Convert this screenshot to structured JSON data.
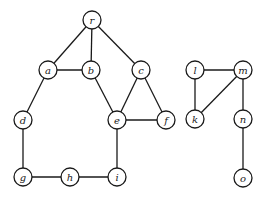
{
  "diagram": {
    "type": "undirected-graph",
    "node_radius": 9,
    "colors": {
      "stroke": "#1a1a1a",
      "fill": "#ffffff"
    },
    "nodes": [
      {
        "id": "r",
        "label": "r",
        "x": 92,
        "y": 20
      },
      {
        "id": "a",
        "label": "a",
        "x": 48,
        "y": 70
      },
      {
        "id": "b",
        "label": "b",
        "x": 91,
        "y": 70
      },
      {
        "id": "c",
        "label": "c",
        "x": 141,
        "y": 70
      },
      {
        "id": "d",
        "label": "d",
        "x": 23,
        "y": 120
      },
      {
        "id": "e",
        "label": "e",
        "x": 117,
        "y": 120
      },
      {
        "id": "f",
        "label": "f",
        "x": 166,
        "y": 120
      },
      {
        "id": "g",
        "label": "g",
        "x": 23,
        "y": 177
      },
      {
        "id": "h",
        "label": "h",
        "x": 70,
        "y": 177
      },
      {
        "id": "i",
        "label": "i",
        "x": 117,
        "y": 177
      },
      {
        "id": "l",
        "label": "l",
        "x": 195,
        "y": 70
      },
      {
        "id": "m",
        "label": "m",
        "x": 243,
        "y": 70
      },
      {
        "id": "k",
        "label": "k",
        "x": 195,
        "y": 119
      },
      {
        "id": "n",
        "label": "n",
        "x": 243,
        "y": 119
      },
      {
        "id": "o",
        "label": "o",
        "x": 243,
        "y": 178
      }
    ],
    "edges": [
      [
        "r",
        "a"
      ],
      [
        "r",
        "b"
      ],
      [
        "r",
        "c"
      ],
      [
        "a",
        "b"
      ],
      [
        "a",
        "d"
      ],
      [
        "b",
        "e"
      ],
      [
        "c",
        "e"
      ],
      [
        "c",
        "f"
      ],
      [
        "e",
        "f"
      ],
      [
        "e",
        "i"
      ],
      [
        "d",
        "g"
      ],
      [
        "g",
        "h"
      ],
      [
        "h",
        "i"
      ],
      [
        "l",
        "m"
      ],
      [
        "l",
        "k"
      ],
      [
        "m",
        "k"
      ],
      [
        "m",
        "n"
      ],
      [
        "n",
        "o"
      ]
    ]
  }
}
